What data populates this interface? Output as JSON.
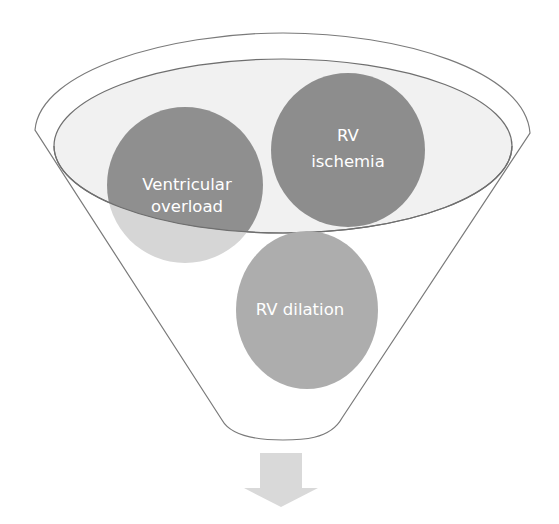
{
  "diagram": {
    "type": "funnel",
    "circles": [
      {
        "id": "ventricular-overload",
        "lines": [
          "Ventricular",
          "overload"
        ],
        "color": "#8f8f8f",
        "lower_color": "#d6d6d6"
      },
      {
        "id": "rv-ischemia",
        "lines": [
          "RV",
          "ischemia"
        ],
        "color": "#8d8d8d",
        "lower_color": "#d3d3d3"
      },
      {
        "id": "rv-dilation",
        "lines": [
          "RV dilation"
        ],
        "color": "#adadad"
      }
    ],
    "colors": {
      "funnel_outline": "#7a7a7a",
      "funnel_inner_fill": "#f1f1f1",
      "arrow": "#d9d9d9",
      "text": "#ffffff"
    },
    "output_arrow": "down-arrow"
  }
}
